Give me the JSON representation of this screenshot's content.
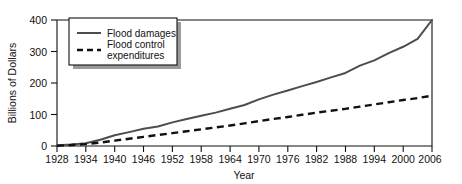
{
  "chart_data": {
    "type": "line",
    "title": "",
    "xlabel": "Year",
    "ylabel": "Billions of Dollars",
    "xlim": [
      1928,
      2006
    ],
    "ylim": [
      0,
      400
    ],
    "grid": false,
    "legend_position": "top-left",
    "xticks": [
      1928,
      1934,
      1940,
      1946,
      1952,
      1958,
      1964,
      1970,
      1976,
      1982,
      1988,
      1994,
      2000,
      2006
    ],
    "yticks": [
      0,
      100,
      200,
      300,
      400
    ],
    "x": [
      1928,
      1931,
      1934,
      1937,
      1940,
      1943,
      1946,
      1949,
      1952,
      1955,
      1958,
      1961,
      1964,
      1967,
      1970,
      1973,
      1976,
      1979,
      1982,
      1985,
      1988,
      1991,
      1994,
      1997,
      2000,
      2003,
      2006
    ],
    "series": [
      {
        "name": "Flood damages",
        "style": "solid",
        "color": "#4d4d4d",
        "values": [
          2,
          5,
          9,
          20,
          34,
          44,
          55,
          62,
          75,
          86,
          96,
          106,
          118,
          130,
          148,
          163,
          176,
          190,
          203,
          218,
          232,
          255,
          272,
          295,
          315,
          340,
          400
        ]
      },
      {
        "name": "Flood control expenditures",
        "style": "dashed",
        "color": "#111111",
        "values": [
          1,
          3,
          6,
          11,
          17,
          23,
          29,
          35,
          41,
          47,
          53,
          59,
          65,
          72,
          79,
          86,
          92,
          99,
          106,
          112,
          118,
          125,
          132,
          139,
          146,
          152,
          160
        ]
      }
    ]
  },
  "axes": {
    "y_title": "Billions of Dollars",
    "x_title": "Year",
    "y_tick_labels": [
      "0",
      "100",
      "200",
      "300",
      "400"
    ],
    "x_tick_labels": [
      "1928",
      "1934",
      "1940",
      "1946",
      "1952",
      "1958",
      "1964",
      "1970",
      "1976",
      "1982",
      "1988",
      "1994",
      "2000",
      "2006"
    ]
  },
  "legend": {
    "entries": [
      {
        "label": "Flood damages",
        "style": "solid"
      },
      {
        "label_line1": "Flood control",
        "label_line2": "expenditures",
        "style": "dashed"
      }
    ]
  }
}
